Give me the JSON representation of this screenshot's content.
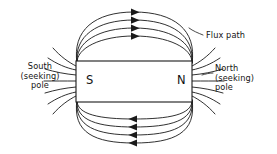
{
  "diagram": {
    "background_color": "#ffffff",
    "line_color": "#1a1a1a",
    "labels": {
      "flux_path": "Flux path",
      "south_line1": "South",
      "south_line2": "(seeking)",
      "south_line3": "pole",
      "north_line1": "North",
      "north_line2": "(seeking)",
      "north_line3": "pole"
    },
    "magnet": {
      "fill": "#ffffff",
      "stroke": "#1a1a1a",
      "south_pole_letter": "S",
      "north_pole_letter": "N",
      "x": 76,
      "y": 61,
      "width": 116,
      "height": 41
    },
    "flux": {
      "loop_count_top": 4,
      "loop_count_bottom": 4,
      "top_arrow_direction": "right",
      "bottom_arrow_direction": "left",
      "fringe_line_count_per_pole": 7
    }
  }
}
